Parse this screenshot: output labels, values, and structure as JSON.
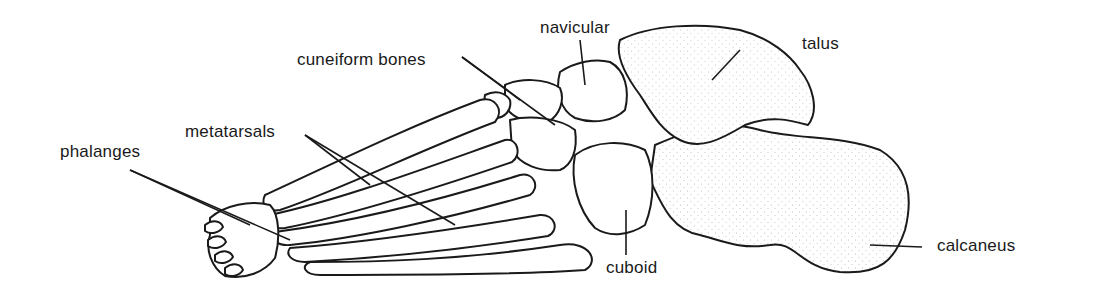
{
  "diagram": {
    "labels": {
      "navicular": "navicular",
      "cuneiform": "cuneiform bones",
      "talus": "talus",
      "metatarsals": "metatarsals",
      "phalanges": "phalanges",
      "cuboid": "cuboid",
      "calcaneus": "calcaneus"
    },
    "colors": {
      "ink": "#1a1a1a",
      "background": "#ffffff",
      "stipple": "#333333"
    }
  }
}
